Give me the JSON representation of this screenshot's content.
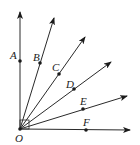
{
  "diagram": {
    "type": "geometry-rays",
    "origin": {
      "label": "O",
      "x": 20,
      "y": 129
    },
    "right_angle_marker": true,
    "rays": [
      {
        "name": "ray-OA",
        "end": [
          20,
          12
        ],
        "point": {
          "label": "A",
          "x": 20,
          "y": 61,
          "lx": 10,
          "ly": 58
        }
      },
      {
        "name": "ray-OB",
        "end": [
          54,
          18
        ],
        "point": {
          "label": "B",
          "x": 40,
          "y": 63,
          "lx": 33,
          "ly": 60
        }
      },
      {
        "name": "ray-OC",
        "end": [
          85,
          37
        ],
        "point": {
          "label": "C",
          "x": 59,
          "y": 74,
          "lx": 52,
          "ly": 70
        }
      },
      {
        "name": "ray-OD",
        "end": [
          111,
          62
        ],
        "point": {
          "label": "D",
          "x": 74,
          "y": 89,
          "lx": 66,
          "ly": 87
        }
      },
      {
        "name": "ray-OE",
        "end": [
          127,
          96
        ],
        "point": {
          "label": "E",
          "x": 83,
          "y": 109,
          "lx": 80,
          "ly": 104
        }
      },
      {
        "name": "ray-OF",
        "end": [
          130,
          130
        ],
        "point": {
          "label": "F",
          "x": 86,
          "y": 130,
          "lx": 83,
          "ly": 125
        }
      }
    ]
  },
  "labels": {
    "O": "O",
    "A": "A",
    "B": "B",
    "C": "C",
    "D": "D",
    "E": "E",
    "F": "F"
  }
}
